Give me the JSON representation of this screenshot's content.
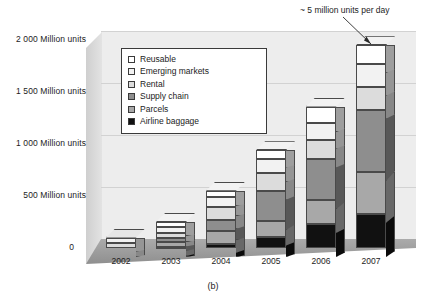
{
  "figure": {
    "caption": "(b)",
    "annotation": "~ 5 million units per day"
  },
  "axes": {
    "y_ticks": [
      {
        "label": "2 000 Million units",
        "value": 2000
      },
      {
        "label": "1 500 Million units",
        "value": 1500
      },
      {
        "label": "1 000 Million units",
        "value": 1000
      },
      {
        "label": "500 Million units",
        "value": 500
      },
      {
        "label": "0",
        "value": 0
      }
    ],
    "x_ticks": [
      "2002",
      "2003",
      "2004",
      "2005",
      "2006",
      "2007"
    ]
  },
  "legend": {
    "items": [
      {
        "label": "Reusable",
        "color": "#ffffff"
      },
      {
        "label": "Emerging markets",
        "color": "#f2f2f2"
      },
      {
        "label": "Rental",
        "color": "#dcdcdc"
      },
      {
        "label": "Supply chain",
        "color": "#8e8e8e"
      },
      {
        "label": "Parcels",
        "color": "#a8a8a8"
      },
      {
        "label": "Airline baggage",
        "color": "#111111"
      }
    ]
  },
  "colors": {
    "plot_background": "#ededed",
    "floor": "#9f9f9f",
    "gridline": "#d2d2d2",
    "outline": "#4a4a4a",
    "page_background": "#ffffff"
  },
  "chart_data": {
    "type": "bar",
    "title": "",
    "xlabel": "",
    "ylabel": "Million units",
    "ylim": [
      0,
      2000
    ],
    "grid": true,
    "stacked": true,
    "legend_position": "inside-top-left",
    "annotations": [
      "~ 5 million units per day"
    ],
    "categories": [
      "2002",
      "2003",
      "2004",
      "2005",
      "2006",
      "2007"
    ],
    "series": [
      {
        "name": "Airline baggage",
        "color": "#111111",
        "values": [
          0,
          10,
          40,
          110,
          230,
          330
        ]
      },
      {
        "name": "Parcels",
        "color": "#a8a8a8",
        "values": [
          0,
          50,
          120,
          150,
          230,
          400
        ]
      },
      {
        "name": "Supply chain",
        "color": "#8e8e8e",
        "values": [
          0,
          40,
          110,
          290,
          400,
          600
        ]
      },
      {
        "name": "Rental",
        "color": "#dcdcdc",
        "values": [
          50,
          40,
          120,
          170,
          180,
          220
        ]
      },
      {
        "name": "Emerging markets",
        "color": "#f2f2f2",
        "values": [
          50,
          60,
          100,
          140,
          160,
          220
        ]
      },
      {
        "name": "Reusable",
        "color": "#ffffff",
        "values": [
          0,
          50,
          60,
          80,
          160,
          180
        ]
      }
    ],
    "totals": [
      100,
      250,
      550,
      940,
      1360,
      1950
    ]
  }
}
